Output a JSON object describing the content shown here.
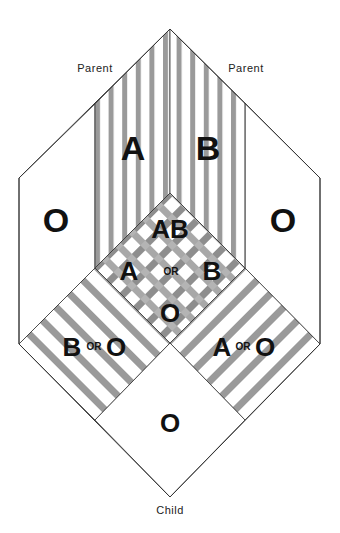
{
  "diagram": {
    "labels": {
      "parent_left": "Parent",
      "parent_right": "Parent",
      "child": "Child"
    },
    "regions": {
      "left_parent_type": "A",
      "right_parent_type": "B",
      "left_outer_type": "O",
      "right_outer_type": "O",
      "center": {
        "top": "AB",
        "left": "A",
        "or": "OR",
        "right": "B",
        "bottom": "O"
      },
      "lower_left": {
        "first": "B",
        "or": "OR",
        "second": "O"
      },
      "lower_right": {
        "first": "A",
        "or": "OR",
        "second": "O"
      },
      "bottom": "O"
    },
    "colors": {
      "stripe": "#9a9a9a",
      "background": "#ffffff",
      "outline": "#333333",
      "text": "#111111"
    }
  }
}
